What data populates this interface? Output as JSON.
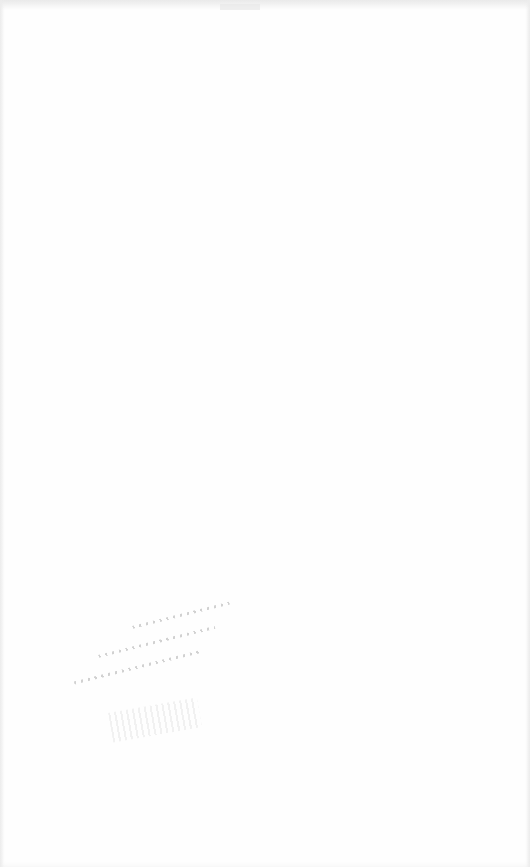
{
  "page": {
    "background_color": "#fefefe",
    "edge_color": "#eaeaea"
  },
  "artifacts": [
    {
      "kind": "faint-illegible-marks",
      "region": "lower-left",
      "text": ""
    },
    {
      "kind": "faint-smudge",
      "region": "lower-left",
      "text": ""
    }
  ]
}
